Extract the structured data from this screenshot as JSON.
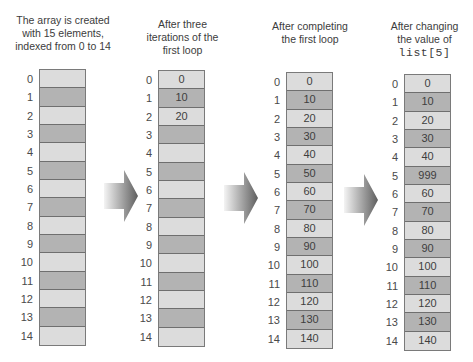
{
  "captions": [
    {
      "lines": [
        "The array is created",
        "with 15 elements,",
        "indexed from 0 to 14"
      ]
    },
    {
      "lines": [
        "After three",
        "iterations of the",
        "first loop"
      ]
    },
    {
      "lines": [
        "After completing",
        "the first loop"
      ]
    },
    {
      "lines": [
        "After changing",
        "the value of"
      ],
      "code": "list[5]"
    }
  ],
  "indices": [
    "0",
    "1",
    "2",
    "3",
    "4",
    "5",
    "6",
    "7",
    "8",
    "9",
    "10",
    "11",
    "12",
    "13",
    "14"
  ],
  "arrays": [
    {
      "name": "initial",
      "values": [
        "",
        "",
        "",
        "",
        "",
        "",
        "",
        "",
        "",
        "",
        "",
        "",
        "",
        "",
        ""
      ]
    },
    {
      "name": "after-three-iterations",
      "values": [
        "0",
        "10",
        "20",
        "",
        "",
        "",
        "",
        "",
        "",
        "",
        "",
        "",
        "",
        "",
        ""
      ]
    },
    {
      "name": "after-first-loop",
      "values": [
        "0",
        "10",
        "20",
        "30",
        "40",
        "50",
        "60",
        "70",
        "80",
        "90",
        "100",
        "110",
        "120",
        "130",
        "140"
      ]
    },
    {
      "name": "after-change",
      "values": [
        "0",
        "10",
        "20",
        "30",
        "40",
        "999",
        "60",
        "70",
        "80",
        "90",
        "100",
        "110",
        "120",
        "130",
        "140"
      ]
    }
  ],
  "colors": {
    "cell_light": "#dcdcdc",
    "cell_dark": "#b3b3b3",
    "border": "#7a7a7a",
    "arrow_dark": "#6a6a6a",
    "arrow_light": "#f2f2f2"
  }
}
